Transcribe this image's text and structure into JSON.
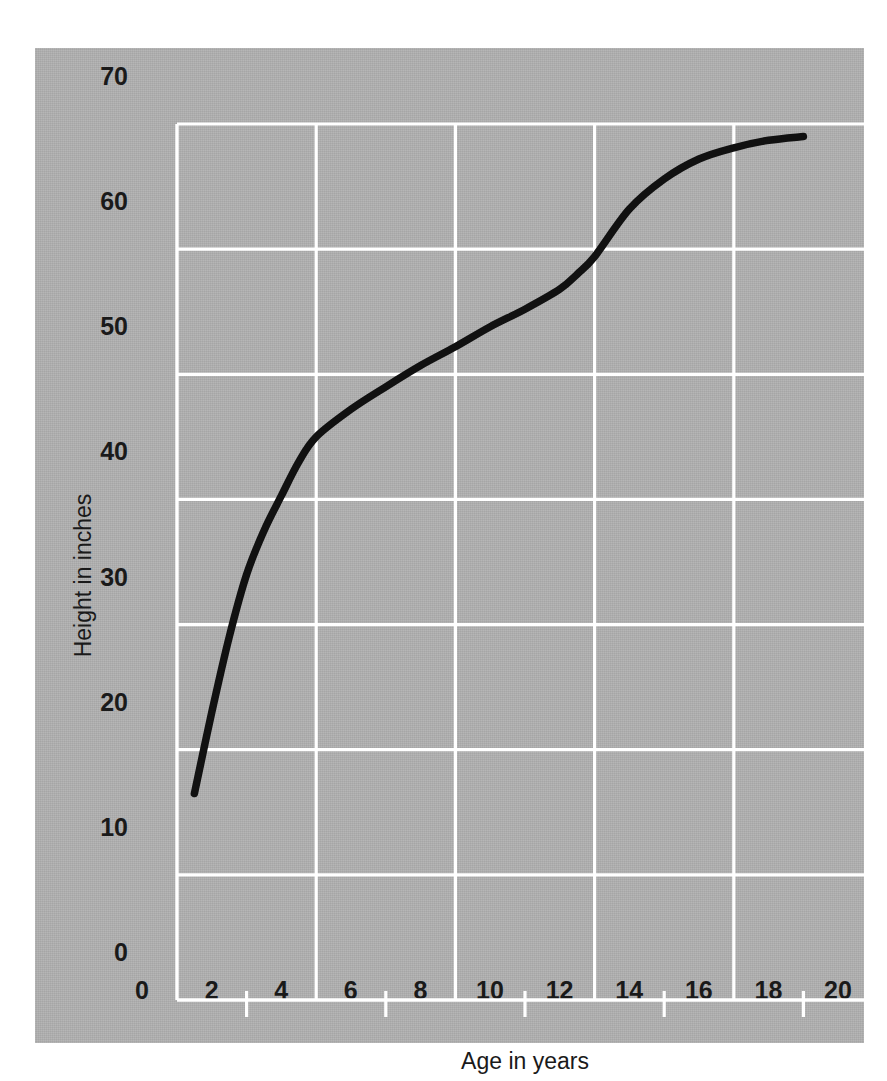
{
  "figure": {
    "background_color": "#b1b1b1",
    "page_color": "#ffffff",
    "gridline_color": "#ffffff",
    "curve_color": "#111111",
    "text_color": "#1a1a1a"
  },
  "chart_data": {
    "type": "line",
    "title": "",
    "xlabel": "Age in years",
    "ylabel": "Height in inches",
    "xlim": [
      0,
      20
    ],
    "ylim": [
      0,
      70
    ],
    "grid": true,
    "legend": "none",
    "x_tick_labels": [
      "0",
      "2",
      "4",
      "6",
      "8",
      "10",
      "12",
      "14",
      "16",
      "18",
      "20"
    ],
    "x_tick_values": [
      0,
      2,
      4,
      6,
      8,
      10,
      12,
      14,
      16,
      18,
      20
    ],
    "x_gridline_values": [
      4,
      8,
      12,
      16
    ],
    "x_minor_tickmark_values": [
      2,
      6,
      10,
      14,
      18
    ],
    "y_tick_labels": [
      "0",
      "10",
      "20",
      "30",
      "40",
      "50",
      "60",
      "70"
    ],
    "y_tick_values": [
      0,
      10,
      20,
      30,
      40,
      50,
      60,
      70
    ],
    "y_gridline_values": [
      10,
      20,
      30,
      40,
      50,
      60,
      70
    ],
    "series": [
      {
        "name": "Height",
        "x": [
          0.5,
          1.0,
          1.5,
          2.0,
          2.5,
          3.0,
          3.5,
          4.0,
          5.0,
          6.0,
          7.0,
          8.0,
          9.0,
          10.0,
          11.0,
          11.5,
          12.0,
          13.0,
          14.0,
          15.0,
          16.0,
          17.0,
          18.0
        ],
        "values": [
          16.5,
          23.0,
          29.0,
          34.0,
          37.5,
          40.3,
          43.0,
          45.0,
          47.2,
          49.0,
          50.7,
          52.2,
          53.8,
          55.2,
          56.8,
          58.0,
          59.4,
          63.2,
          65.6,
          67.2,
          68.1,
          68.7,
          69.0
        ]
      }
    ]
  }
}
